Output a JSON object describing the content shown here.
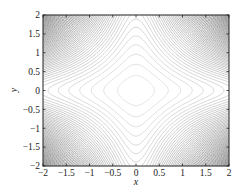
{
  "chart_data": {
    "type": "contour",
    "title": "",
    "xlabel": "x",
    "ylabel": "y",
    "xlim": [
      -2,
      2
    ],
    "ylim": [
      -2,
      2
    ],
    "xticks": [
      -2,
      -1.5,
      -1,
      -0.5,
      0,
      0.5,
      1,
      1.5,
      2
    ],
    "yticks": [
      -2,
      -1.5,
      -1,
      -0.5,
      0,
      0.5,
      1,
      1.5,
      2
    ],
    "xtick_labels": [
      "−2",
      "−1.5",
      "−1",
      "−0.5",
      "0",
      "0.5",
      "1",
      "1.5",
      "2"
    ],
    "ytick_labels": [
      "−2",
      "−1.5",
      "−1",
      "−0.5",
      "0",
      "0.5",
      "1",
      "1.5",
      "2"
    ],
    "grid": false,
    "legend": null,
    "function": "x^2 * y^2 + 0.15*(x^2 + y^2)",
    "levels": 60,
    "line_color_light": "#d8d8d8",
    "line_color_dark": "#1a1a1a"
  },
  "plot_area": {
    "left": 43,
    "top": 15,
    "right": 229,
    "bottom": 166
  }
}
